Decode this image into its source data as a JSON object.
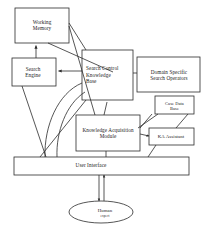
{
  "diagram": {
    "background_color": "#ffffff",
    "line_color": "#2b2b2b",
    "text_color": "#1a1a1a",
    "nodes": {
      "working_memory": {
        "name": "working-memory",
        "shape": "rectangle",
        "lines": [
          "Working",
          "Memory"
        ]
      },
      "search_engine": {
        "name": "search-engine",
        "shape": "rectangle",
        "lines": [
          "Search",
          "Engine"
        ]
      },
      "search_control_kb": {
        "name": "search-control-knowledge-base",
        "shape": "rectangle",
        "lines": [
          "Search Control",
          "Knowledge",
          "Base"
        ]
      },
      "domain_specific_search_operators": {
        "name": "domain-specific-search-operators",
        "shape": "rectangle",
        "lines": [
          "Domain Specific",
          "Search Operators"
        ]
      },
      "knowledge_acquisition_module": {
        "name": "knowledge-acquisition-module",
        "shape": "rectangle",
        "lines": [
          "Knowledge Acquisition",
          "Module"
        ]
      },
      "case_data_base": {
        "name": "case-data-base",
        "shape": "rectangle",
        "lines": [
          "Case Data",
          "Base"
        ]
      },
      "ka_assistant": {
        "name": "ka-assistant",
        "shape": "rectangle",
        "lines": [
          "KA  Assistant"
        ]
      },
      "user_interface": {
        "name": "user-interface",
        "shape": "rectangle-wide",
        "lines": [
          "User Interface"
        ]
      },
      "human": {
        "name": "human",
        "shape": "ellipse",
        "lines": [
          "Human"
        ],
        "sub": "expert"
      }
    },
    "edges": [
      {
        "from": "working_memory",
        "to": "search_engine",
        "style": "arrow-up"
      },
      {
        "from": "working_memory",
        "to": "search_control_kb",
        "style": "line"
      },
      {
        "from": "working_memory",
        "to": "knowledge_acquisition_module",
        "style": "line"
      },
      {
        "from": "search_control_kb",
        "to": "search_engine",
        "style": "arrow-left"
      },
      {
        "from": "search_control_kb",
        "to": "domain_specific_search_operators",
        "style": "line"
      },
      {
        "from": "search_control_kb",
        "to": "knowledge_acquisition_module",
        "style": "arrow-up"
      },
      {
        "from": "search_control_kb",
        "to": "user_interface",
        "style": "curve"
      },
      {
        "from": "search_engine",
        "to": "user_interface",
        "style": "line"
      },
      {
        "from": "knowledge_acquisition_module",
        "to": "ka_assistant",
        "style": "arrow-both"
      },
      {
        "from": "case_data_base",
        "to": "knowledge_acquisition_module",
        "style": "line"
      },
      {
        "from": "case_data_base",
        "to": "ka_assistant",
        "style": "line"
      },
      {
        "from": "knowledge_acquisition_module",
        "to": "user_interface",
        "style": "line"
      },
      {
        "from": "ka_assistant",
        "to": "user_interface",
        "style": "line"
      },
      {
        "from": "user_interface",
        "to": "human",
        "style": "double-line"
      }
    ]
  }
}
